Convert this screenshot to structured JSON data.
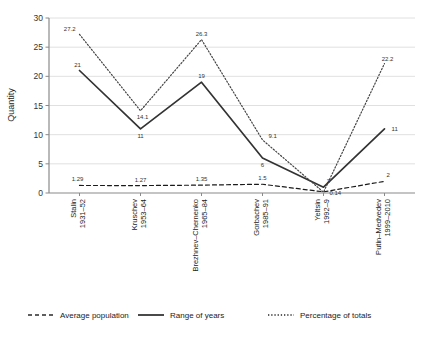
{
  "chart_data": {
    "type": "line",
    "title": "",
    "xlabel": "",
    "ylabel": "Quantity",
    "ylim": [
      0,
      30
    ],
    "yticks": [
      "0",
      "5",
      "10",
      "15",
      "20",
      "25",
      "30"
    ],
    "grid": true,
    "legend_position": "bottom",
    "categories": [
      "Stalin\n1931–52",
      "Kruschev\n1953–64",
      "Brezhnev–Chernenko\n1965–84",
      "Gorbachev\n1985–91",
      "Yeltsin\n1992–9",
      "Putin–Medvedev\n1999–2010"
    ],
    "category_lines": [
      [
        "Stalin",
        "1931–52"
      ],
      [
        "Kruschev",
        "1953–64"
      ],
      [
        "Brezhnev–Chernenko",
        "1965–84"
      ],
      [
        "Gorbachev",
        "1985–91"
      ],
      [
        "Yeltsin",
        "1992–9"
      ],
      [
        "Putin–Medvedev",
        "1999–2010"
      ]
    ],
    "series": [
      {
        "name": "Average population",
        "style": "dashed",
        "color": "#1a1a1a",
        "values": [
          1.29,
          1.27,
          1.35,
          1.5,
          0.2,
          2
        ],
        "labels": [
          "1.29",
          "1.27",
          "1.35",
          "1.5",
          "",
          "2"
        ]
      },
      {
        "name": "Range of years",
        "style": "solid",
        "color": "#333333",
        "values": [
          21,
          11,
          19,
          6,
          1,
          11
        ],
        "labels": [
          "21",
          "11",
          "19",
          "6",
          "1",
          "11"
        ]
      },
      {
        "name": "Percentage of totals",
        "style": "dotted",
        "color": "#444444",
        "values": [
          27.2,
          14.1,
          26.3,
          9.1,
          0.14,
          22.2
        ],
        "labels": [
          "27.2",
          "14.1",
          "26.3",
          "9.1",
          "0.14",
          "22.2"
        ]
      }
    ]
  },
  "legend": {
    "items": [
      {
        "label": "Average population",
        "style": "dashed"
      },
      {
        "label": "Range of years",
        "style": "solid"
      },
      {
        "label": "Percentage of totals",
        "style": "dotted"
      }
    ]
  },
  "axis": {
    "y_title": "Quantity"
  }
}
